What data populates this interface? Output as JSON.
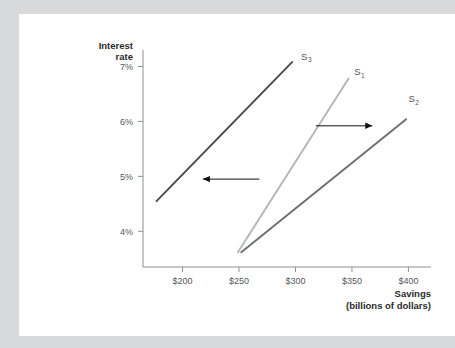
{
  "page": {
    "background_color": "#d8d9da",
    "card_color": "#ffffff"
  },
  "chart_data": {
    "type": "line",
    "title": "",
    "xlabel": "Savings",
    "xlabel_line2": "(billions of dollars)",
    "ylabel_line1": "Interest",
    "ylabel_line2": "rate",
    "xlim": [
      165,
      420
    ],
    "ylim": [
      3.35,
      7.3
    ],
    "x_ticks": [
      "$200",
      "$250",
      "$300",
      "$350",
      "$400"
    ],
    "x_tick_values": [
      200,
      250,
      300,
      350,
      400
    ],
    "y_ticks": [
      "4%",
      "5%",
      "6%",
      "7%"
    ],
    "y_tick_values": [
      4,
      5,
      6,
      7
    ],
    "grid": false,
    "legend": "none",
    "series": [
      {
        "name": "S3",
        "label": "S",
        "subscript": "3",
        "color": "#4a4c50",
        "x": [
          177,
          297
        ],
        "y": [
          4.55,
          7.08
        ],
        "label_x": 305,
        "label_y": 7.12
      },
      {
        "name": "S1",
        "label": "S",
        "subscript": "1",
        "color": "#b6b7b9",
        "x": [
          249,
          347
        ],
        "y": [
          3.62,
          6.78
        ],
        "label_x": 352,
        "label_y": 6.84
      },
      {
        "name": "S2",
        "label": "S",
        "subscript": "2",
        "color": "#6e7072",
        "x": [
          252,
          398
        ],
        "y": [
          3.62,
          6.04
        ],
        "label_x": 400,
        "label_y": 6.35
      }
    ],
    "annotations": [
      {
        "name": "shift-left-arrow",
        "direction": "left",
        "x_start": 268,
        "x_end": 218,
        "y": 4.95
      },
      {
        "name": "shift-right-arrow",
        "direction": "right",
        "x_start": 318,
        "x_end": 368,
        "y": 5.92
      }
    ]
  }
}
